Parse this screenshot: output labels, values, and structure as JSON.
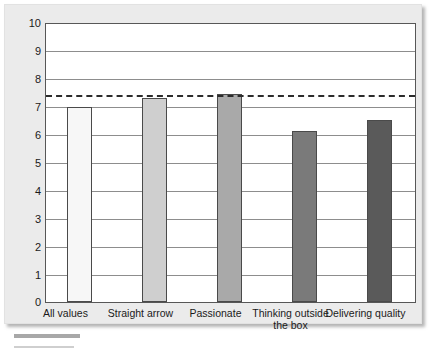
{
  "chart_data": {
    "type": "bar",
    "title": "",
    "xlabel": "",
    "ylabel": "",
    "categories": [
      "All values",
      "Straight arrow",
      "Passionate",
      "Thinking outside the box",
      "Delivering quality"
    ],
    "values": [
      7.0,
      7.35,
      7.5,
      6.15,
      6.55
    ],
    "ylim": [
      0,
      10
    ],
    "yticks": [
      "10",
      "9",
      "8",
      "7",
      "6",
      "5",
      "4",
      "3",
      "2",
      "1",
      "0"
    ],
    "grid": true,
    "legend": "none",
    "annotations": [
      {
        "name": "reference-line",
        "type": "horizontal-dashed-line",
        "value": 7.45,
        "color": "#2b2b2b"
      }
    ],
    "bar_colors": [
      "#f7f7f7",
      "#cfcfcf",
      "#a9a9a9",
      "#7a7a7a",
      "#5a5a5a"
    ],
    "bar_border_color": "#4a4a4a",
    "plot_background": "#ffffff",
    "panel_background": "#ebebeb",
    "gridline_color": "#8d8d8d"
  }
}
